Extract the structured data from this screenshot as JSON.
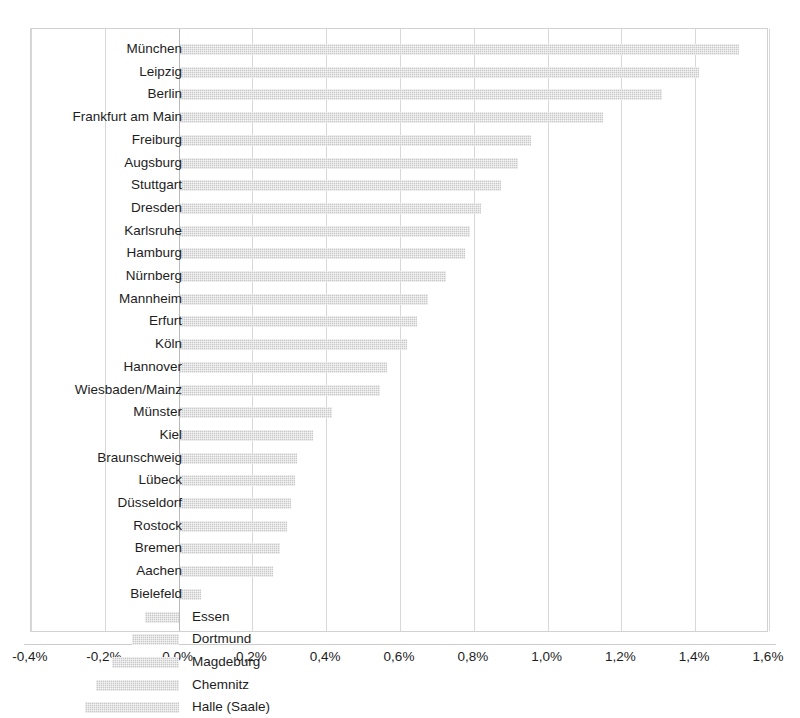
{
  "chart_data": {
    "type": "bar",
    "orientation": "horizontal",
    "title": "",
    "subtitle": "",
    "xlabel": "",
    "ylabel": "",
    "xlim": [
      -0.4,
      1.6
    ],
    "xtick_step": 0.2,
    "grid": true,
    "legend": "none",
    "value_unit": "%",
    "decimal_separator": ",",
    "bar_color": "#c9c9c9",
    "gridline_color": "#d8d8d8",
    "zero_line_color": "#b9b9b9",
    "xticks": [
      "-0,4%",
      "-0,2%",
      "0,0%",
      "0,2%",
      "0,4%",
      "0,6%",
      "0,8%",
      "1,0%",
      "1,2%",
      "1,4%",
      "1,6%"
    ],
    "xtick_values": [
      -0.4,
      -0.2,
      0.0,
      0.2,
      0.4,
      0.6,
      0.8,
      1.0,
      1.2,
      1.4,
      1.6
    ],
    "categories": [
      "München",
      "Leipzig",
      "Berlin",
      "Frankfurt am Main",
      "Freiburg",
      "Augsburg",
      "Stuttgart",
      "Dresden",
      "Karlsruhe",
      "Hamburg",
      "Nürnberg",
      "Mannheim",
      "Erfurt",
      "Köln",
      "Hannover",
      "Wiesbaden/Mainz",
      "Münster",
      "Kiel",
      "Braunschweig",
      "Lübeck",
      "Düsseldorf",
      "Rostock",
      "Bremen",
      "Aachen",
      "Bielefeld",
      "Essen",
      "Dortmund",
      "Magdeburg",
      "Chemnitz",
      "Halle (Saale)"
    ],
    "values": [
      1.52,
      1.41,
      1.31,
      1.15,
      0.955,
      0.92,
      0.875,
      0.82,
      0.79,
      0.775,
      0.725,
      0.675,
      0.645,
      0.62,
      0.565,
      0.545,
      0.415,
      0.365,
      0.32,
      0.315,
      0.305,
      0.295,
      0.275,
      0.255,
      0.06,
      -0.09,
      -0.125,
      -0.18,
      -0.225,
      -0.255
    ]
  }
}
